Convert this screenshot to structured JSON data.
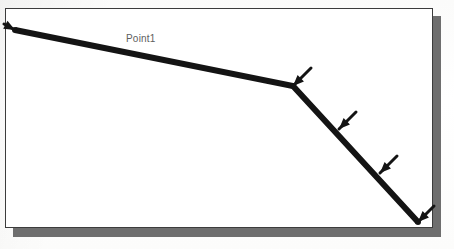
{
  "figure": {
    "kind": "cad-line-diagram",
    "background_color": "#fdfdfc",
    "sheet_color": "#ffffff",
    "sheet_border_color": "#3c3c3c",
    "shadow_color": "#6e6e6e",
    "line_color": "#141414",
    "label_color": "#5e5e5e"
  },
  "sheet": {
    "x": 5,
    "y": 8,
    "width": 428,
    "height": 220
  },
  "shadow": {
    "x": 13,
    "y": 16,
    "width": 428,
    "height": 221
  },
  "labels": [
    {
      "name": "point1-label",
      "text": "Point1",
      "x": 126,
      "y": 33
    }
  ],
  "chart_data": {
    "type": "line",
    "title": "",
    "xlabel": "",
    "ylabel": "",
    "grid": false,
    "legend": null,
    "polyline": {
      "name": "member-polyline",
      "stroke_color": "#141414",
      "stroke_width": 6,
      "points": [
        {
          "name": "start-node",
          "x": 15,
          "y": 30
        },
        {
          "name": "kink-node",
          "x": 293,
          "y": 86
        },
        {
          "name": "end-node",
          "x": 418,
          "y": 222
        }
      ]
    },
    "markers": [
      {
        "name": "arrow-start-node",
        "kind": "arrow",
        "x": 15,
        "y": 30,
        "dx": -11,
        "dy": -6,
        "note": "points left at the start node"
      },
      {
        "name": "arrow-kink-node",
        "kind": "arrow",
        "x": 293,
        "y": 86,
        "dx": 18,
        "dy": -18,
        "note": "points up-right at the kink"
      },
      {
        "name": "arrow-mid-upper",
        "kind": "arrow",
        "x": 339,
        "y": 129,
        "dx": 17,
        "dy": -17,
        "note": "points up-right along the descending member"
      },
      {
        "name": "arrow-mid-lower",
        "kind": "arrow",
        "x": 380,
        "y": 173,
        "dx": 17,
        "dy": -17,
        "note": "points up-right along the descending member"
      },
      {
        "name": "arrow-end-node",
        "kind": "arrow",
        "x": 418,
        "y": 222,
        "dx": 16,
        "dy": -16,
        "note": "points up-right at the end node"
      }
    ]
  }
}
